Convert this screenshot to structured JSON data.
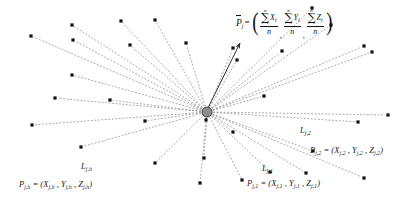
{
  "figure": {
    "background": "#ffffff",
    "ink": "#1a1a1a",
    "hub_fill": "#8c8c8c",
    "hub_stroke": "#333333",
    "dot_color": "#111111",
    "ray_color": "#9a9a9a",
    "arrow_color": "#333333",
    "center": {
      "x": 207,
      "y": 112,
      "r": 5
    },
    "arrow": {
      "x1": 207,
      "y1": 110,
      "x2": 240,
      "y2": 43
    }
  },
  "formula": {
    "lhs": "P",
    "lhs_sub": "j",
    "equals": "=",
    "open_paren": "(",
    "close_paren": ")",
    "sigma": "∑",
    "upper_limit": "n",
    "lower_limit": "i=1",
    "denominator": "n",
    "terms": [
      {
        "var": "X",
        "var_sub": "i"
      },
      {
        "var": "Y",
        "var_sub": "i"
      },
      {
        "var": "Z",
        "var_sub": "i"
      }
    ],
    "separators": [
      ",",
      ","
    ],
    "plain_text": "P̄j = ( Σ(i=1..n) Xi / n , Σ(i=1..n) Yi / n , Σ(i=1..n) Zi / n )"
  },
  "labels": [
    {
      "id": "L-jh",
      "kind": "line-label",
      "base": "L",
      "sub": "j,h",
      "x": 81,
      "y": 162
    },
    {
      "id": "P-jh",
      "kind": "point-label",
      "text_html": "P<sub>j,h</sub> = (X<sub>j,h</sub> , Y<sub>j,h</sub> , Z<sub>j,h</sub>)",
      "plain": "P j,h = (X j,h , Y j,h , Z j,h)",
      "x": 19,
      "y": 180
    },
    {
      "id": "L-j1",
      "kind": "line-label",
      "base": "L",
      "sub": "j,1",
      "x": 262,
      "y": 164
    },
    {
      "id": "P-j1",
      "kind": "point-label",
      "text_html": "P<sub>j,1</sub> = (X<sub>j,1</sub> , Y<sub>j,1</sub> , Z<sub>j,1</sub>)",
      "plain": "P j,1 = (X j,1 , Y j,1 , Z j,1)",
      "x": 247,
      "y": 179
    },
    {
      "id": "L-j2",
      "kind": "line-label",
      "base": "L",
      "sub": "j,2",
      "x": 300,
      "y": 126
    },
    {
      "id": "P-j2",
      "kind": "point-label",
      "text_html": "P<sub>j,2</sub> = (X<sub>j,2</sub> , Y<sub>j,2</sub> , Z<sub>j,2</sub>)",
      "plain": "P j,2 = (X j,2 , Y j,2 , Z j,2)",
      "x": 310,
      "y": 146
    }
  ],
  "chart_data": {
    "type": "scatter",
    "xlabel": "",
    "ylabel": "",
    "xlim": [
      0,
      414
    ],
    "ylim": [
      0,
      205
    ],
    "grid": false,
    "legend": "none",
    "center": [
      207,
      112
    ],
    "marker": "small black square, 3px",
    "line_style": "dotted gray",
    "endpoints": [
      [
        121,
        21
      ],
      [
        155,
        20
      ],
      [
        72,
        25
      ],
      [
        186,
        43
      ],
      [
        73,
        40
      ],
      [
        31,
        36
      ],
      [
        130,
        45
      ],
      [
        72,
        75
      ],
      [
        55,
        98
      ],
      [
        32,
        125
      ],
      [
        110,
        100
      ],
      [
        81,
        147
      ],
      [
        145,
        121
      ],
      [
        204,
        158
      ],
      [
        155,
        163
      ],
      [
        200,
        183
      ],
      [
        206,
        120
      ],
      [
        233,
        132
      ],
      [
        242,
        180
      ],
      [
        270,
        172
      ],
      [
        313,
        151
      ],
      [
        237,
        60
      ],
      [
        264,
        96
      ],
      [
        282,
        51
      ],
      [
        312,
        8
      ],
      [
        331,
        25
      ],
      [
        364,
        46
      ],
      [
        372,
        52
      ],
      [
        306,
        173
      ],
      [
        364,
        178
      ],
      [
        388,
        115
      ],
      [
        358,
        122
      ],
      [
        233,
        48
      ]
    ],
    "n_rays": 33
  }
}
